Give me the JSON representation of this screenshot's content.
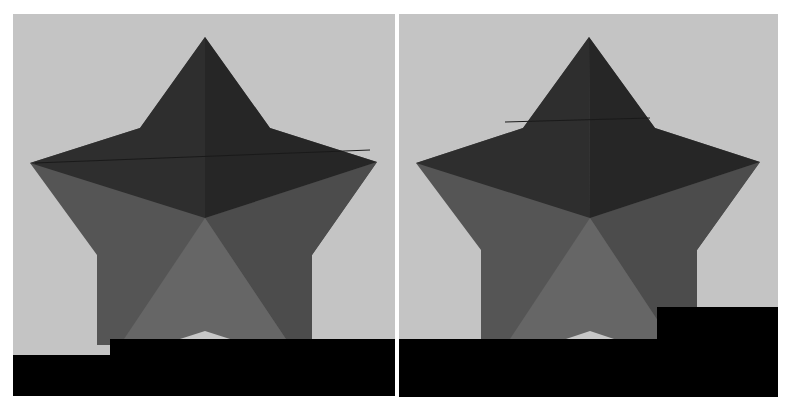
{
  "figure": {
    "panels": [
      {
        "id": "left",
        "description": "3D-rendered star shape on pillar with black occluding block (stepped)",
        "occluder": "stepped-bottom"
      },
      {
        "id": "right",
        "description": "3D-rendered star shape on pillar with black occluding block (raised right block)",
        "occluder": "raised-right-block"
      }
    ]
  },
  "colors": {
    "background": "#c4c4c4",
    "star_top_dark": "#2e2e2e",
    "star_top_darker": "#262626",
    "star_side_mid": "#555555",
    "star_side_right": "#4c4c4c",
    "star_center_light": "#666666",
    "floor_highlight": "#c8c8c8",
    "occluder": "#000000",
    "page_bg": "#ffffff"
  }
}
